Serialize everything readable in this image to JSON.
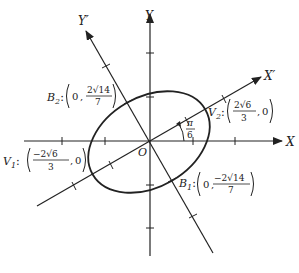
{
  "diagram": {
    "type": "rotated-ellipse",
    "axes": {
      "x_label": "X",
      "y_label": "Y",
      "x_prime_label": "X′",
      "y_prime_label": "Y′",
      "origin_label": "O"
    },
    "rotation_angle": {
      "numerator": "π",
      "denominator": "6"
    },
    "vertices": {
      "v1": {
        "name": "V",
        "sub": "1",
        "num": "−2√6",
        "den": "3",
        "second": "0"
      },
      "v2": {
        "name": "V",
        "sub": "2",
        "num": "2√6",
        "den": "3",
        "second": "0"
      },
      "b1": {
        "name": "B",
        "sub": "1",
        "first": "0",
        "num": "−2√14",
        "den": "7"
      },
      "b2": {
        "name": "B",
        "sub": "2",
        "first": "0",
        "num": "2√14",
        "den": "7"
      }
    },
    "colors": {
      "stroke": "#222222",
      "background": "#ffffff"
    }
  }
}
